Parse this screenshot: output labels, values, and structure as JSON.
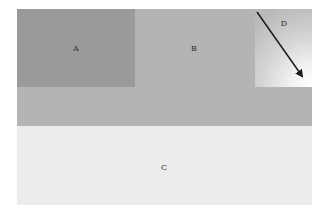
{
  "diagram": {
    "regions": [
      {
        "id": "A",
        "label": "A",
        "color": "#9a9a9a"
      },
      {
        "id": "B",
        "label": "B",
        "color": "#b4b4b4"
      },
      {
        "id": "C",
        "label": "C",
        "color": "#ececec"
      },
      {
        "id": "D",
        "label": "D",
        "color": "gradient"
      }
    ],
    "arrow": {
      "in_region": "D",
      "direction": "down-right"
    }
  }
}
